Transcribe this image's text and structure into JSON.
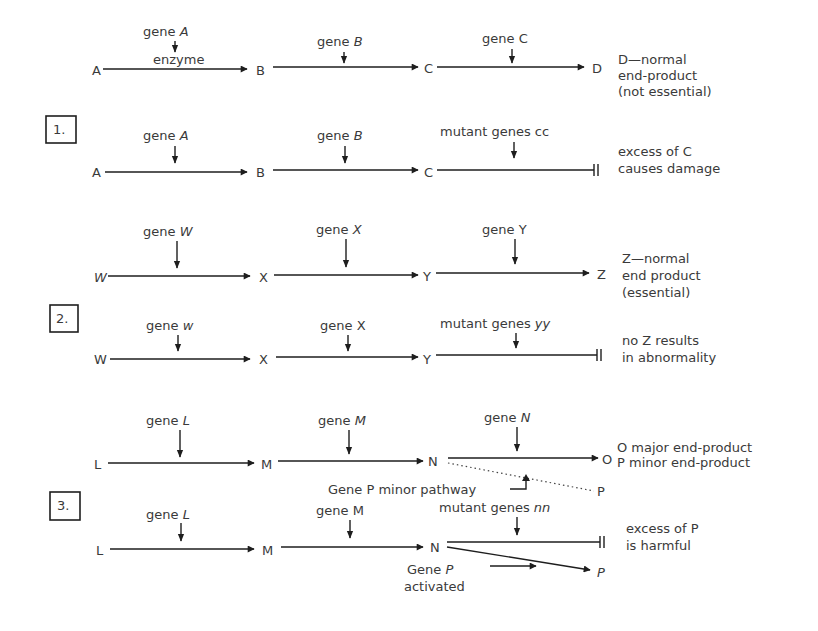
{
  "diagram": {
    "panels": [
      {
        "number": "1.",
        "normal": {
          "nodes": [
            "A",
            "B",
            "C",
            "D"
          ],
          "genes": [
            {
              "prefix": "gene ",
              "name": "A",
              "italic": true
            },
            {
              "prefix": "gene ",
              "name": "B",
              "italic": true
            },
            {
              "prefix": "gene ",
              "name": "C",
              "italic": false
            }
          ],
          "enzyme_label": "enzyme",
          "note": [
            "D—normal",
            "end-product",
            "(not essential)"
          ]
        },
        "mutant": {
          "nodes": [
            "A",
            "B",
            "C"
          ],
          "genes": [
            {
              "prefix": "gene ",
              "name": "A",
              "italic": true
            },
            {
              "prefix": "gene ",
              "name": "B",
              "italic": true
            },
            {
              "prefix": "mutant genes ",
              "name": "cc",
              "italic": false
            }
          ],
          "note": [
            "excess of C",
            "causes damage"
          ]
        }
      },
      {
        "number": "2.",
        "normal": {
          "nodes": [
            "W",
            "X",
            "Y",
            "Z"
          ],
          "genes": [
            {
              "prefix": "gene ",
              "name": "W",
              "italic": true
            },
            {
              "prefix": "gene ",
              "name": "X",
              "italic": true
            },
            {
              "prefix": "gene ",
              "name": "Y",
              "italic": false
            }
          ],
          "note": [
            "Z—normal",
            "end product",
            "(essential)"
          ]
        },
        "mutant": {
          "nodes": [
            "W",
            "X",
            "Y"
          ],
          "genes": [
            {
              "prefix": "gene ",
              "name": "w",
              "italic": true
            },
            {
              "prefix": "gene ",
              "name": "X",
              "italic": false
            },
            {
              "prefix": "mutant genes ",
              "name": "yy",
              "italic": true
            }
          ],
          "note": [
            "no Z results",
            "in abnormality"
          ]
        }
      },
      {
        "number": "3.",
        "normal": {
          "nodes": [
            "L",
            "M",
            "N",
            "O",
            "P"
          ],
          "genes": [
            {
              "prefix": "gene ",
              "name": "L",
              "italic": true
            },
            {
              "prefix": "gene ",
              "name": "M",
              "italic": true
            },
            {
              "prefix": "gene ",
              "name": "N",
              "italic": true
            }
          ],
          "minor_pathway_label": "Gene P  minor pathway",
          "note": [
            "O major end-product",
            "P minor end-product"
          ]
        },
        "mutant": {
          "nodes": [
            "L",
            "M",
            "N",
            "P"
          ],
          "genes": [
            {
              "prefix": "gene ",
              "name": "L",
              "italic": true
            },
            {
              "prefix": "gene ",
              "name": "M",
              "italic": false
            },
            {
              "prefix": "mutant genes ",
              "name": "nn",
              "italic": true
            }
          ],
          "activated_label": {
            "prefix": "Gene ",
            "name": "P",
            "line2": "activated"
          },
          "note": [
            "excess of P",
            "is harmful"
          ]
        }
      }
    ]
  }
}
